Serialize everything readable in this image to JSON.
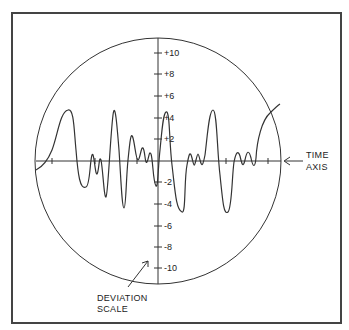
{
  "diagram": {
    "type": "oscilloscope-waveform",
    "frame": {
      "x": 12,
      "y": 13,
      "width": 329,
      "height": 310,
      "stroke": "#444444"
    },
    "circle": {
      "cx": 158,
      "cy": 161,
      "r": 123
    },
    "deviation_scale": {
      "label_line1": "DEVIATION",
      "label_line2": "SCALE",
      "ticks": [
        {
          "value": 10,
          "label": "+10",
          "y": 53
        },
        {
          "value": 8,
          "label": "+8",
          "y": 74
        },
        {
          "value": 6,
          "label": "+6",
          "y": 96
        },
        {
          "value": 4,
          "label": "+4",
          "y": 118
        },
        {
          "value": 2,
          "label": "+2",
          "y": 139
        },
        {
          "value": -2,
          "label": "-2",
          "y": 182
        },
        {
          "value": -4,
          "label": "-4",
          "y": 204
        },
        {
          "value": -6,
          "label": "-6",
          "y": 226
        },
        {
          "value": -8,
          "label": "-8",
          "y": 247
        },
        {
          "value": -10,
          "label": "-10",
          "y": 268
        }
      ]
    },
    "time_axis": {
      "label_line1": "TIME",
      "label_line2": "AXIS",
      "tick_x": [
        52,
        95,
        137,
        184,
        226,
        268
      ]
    },
    "line_color": "#333333"
  }
}
